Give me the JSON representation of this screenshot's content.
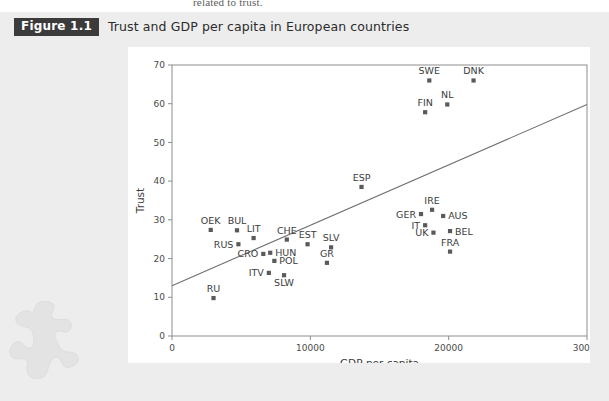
{
  "page": {
    "bleed_text": "related to trust.",
    "background_color": "#ededed",
    "panel_color": "#ffffff"
  },
  "caption": {
    "figure_tag": "Figure 1.1",
    "title": "Trust and GDP per capita in European countries",
    "tag_background": "#3b3b3b",
    "tag_text_color": "#ffffff"
  },
  "decor": {
    "watermark": "puzzle-piece"
  },
  "chart_data": {
    "type": "scatter",
    "title": "Trust and GDP per capita in European countries",
    "xlabel": "GDP per capita",
    "ylabel": "Trust",
    "xlim": [
      0,
      30000
    ],
    "ylim": [
      0,
      70
    ],
    "xticks": [
      0,
      10000,
      20000,
      30000
    ],
    "xticklabels": [
      "0",
      "10000",
      "20000",
      "30000"
    ],
    "yticks": [
      0,
      10,
      20,
      30,
      40,
      50,
      60,
      70
    ],
    "yticklabels": [
      "0",
      "10",
      "20",
      "30",
      "40",
      "50",
      "60",
      "70"
    ],
    "grid": false,
    "legend": "none",
    "marker_color": "#5a5a5a",
    "marker_shape": "square",
    "trendline": {
      "show": true,
      "color": "#6f6f6f",
      "x_start": 0,
      "y_start": 13.0,
      "x_end": 30000,
      "y_end": 59.8
    },
    "points": [
      {
        "label": "SWE",
        "x": 18600,
        "y": 66.0,
        "label_pos": "top"
      },
      {
        "label": "DNK",
        "x": 21800,
        "y": 66.0,
        "label_pos": "top"
      },
      {
        "label": "NL",
        "x": 19900,
        "y": 59.8,
        "label_pos": "top"
      },
      {
        "label": "FIN",
        "x": 18300,
        "y": 57.8,
        "label_pos": "top"
      },
      {
        "label": "ESP",
        "x": 13700,
        "y": 38.5,
        "label_pos": "top"
      },
      {
        "label": "IRE",
        "x": 18800,
        "y": 32.6,
        "label_pos": "top"
      },
      {
        "label": "GER",
        "x": 18000,
        "y": 31.5,
        "label_pos": "left"
      },
      {
        "label": "AUS",
        "x": 19600,
        "y": 31.0,
        "label_pos": "right"
      },
      {
        "label": "IT",
        "x": 18300,
        "y": 28.6,
        "label_pos": "left"
      },
      {
        "label": "UK",
        "x": 18900,
        "y": 26.7,
        "label_pos": "left"
      },
      {
        "label": "BEL",
        "x": 20100,
        "y": 27.1,
        "label_pos": "right"
      },
      {
        "label": "FRA",
        "x": 20100,
        "y": 21.8,
        "label_pos": "top"
      },
      {
        "label": "OEK",
        "x": 2800,
        "y": 27.4,
        "label_pos": "top"
      },
      {
        "label": "BUL",
        "x": 4700,
        "y": 27.3,
        "label_pos": "top"
      },
      {
        "label": "LIT",
        "x": 5900,
        "y": 25.3,
        "label_pos": "top"
      },
      {
        "label": "RUS",
        "x": 4800,
        "y": 23.7,
        "label_pos": "left"
      },
      {
        "label": "CHE",
        "x": 8300,
        "y": 24.9,
        "label_pos": "top"
      },
      {
        "label": "EST",
        "x": 9800,
        "y": 23.7,
        "label_pos": "top"
      },
      {
        "label": "SLV",
        "x": 11500,
        "y": 22.9,
        "label_pos": "top"
      },
      {
        "label": "CRO",
        "x": 6600,
        "y": 21.2,
        "label_pos": "left"
      },
      {
        "label": "HUN",
        "x": 7100,
        "y": 21.5,
        "label_pos": "right"
      },
      {
        "label": "POL",
        "x": 7400,
        "y": 19.4,
        "label_pos": "right"
      },
      {
        "label": "GR",
        "x": 11200,
        "y": 18.9,
        "label_pos": "top"
      },
      {
        "label": "ITV",
        "x": 7000,
        "y": 16.3,
        "label_pos": "left"
      },
      {
        "label": "SLW",
        "x": 8100,
        "y": 15.7,
        "label_pos": "bottom"
      },
      {
        "label": "RU",
        "x": 3000,
        "y": 9.8,
        "label_pos": "top"
      }
    ]
  }
}
